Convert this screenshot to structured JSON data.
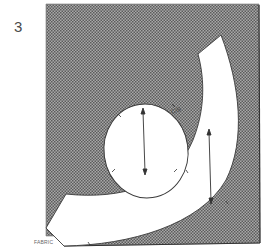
{
  "figure": {
    "step_number": "3",
    "fabric_label": "FABRIC",
    "annotation_symbol": "C/B",
    "colors": {
      "fabric_fill": "#9a9a9a",
      "fabric_dot": "#5e5e5e",
      "pattern_fill": "#ffffff",
      "outline": "#444444"
    },
    "elements": [
      {
        "name": "fabric-area",
        "description": "Dotted (shaded) rectangular fabric"
      },
      {
        "name": "pattern-piece-band",
        "description": "White curved band pattern piece sweeping from top right to bottom left"
      },
      {
        "name": "pattern-piece-oval",
        "description": "White oval pattern piece inside the curve"
      },
      {
        "name": "grainline-arrow-oval",
        "description": "Vertical double-headed grainline arrow in oval piece"
      },
      {
        "name": "grainline-arrow-band",
        "description": "Vertical double-headed grainline arrow in band piece"
      }
    ]
  }
}
